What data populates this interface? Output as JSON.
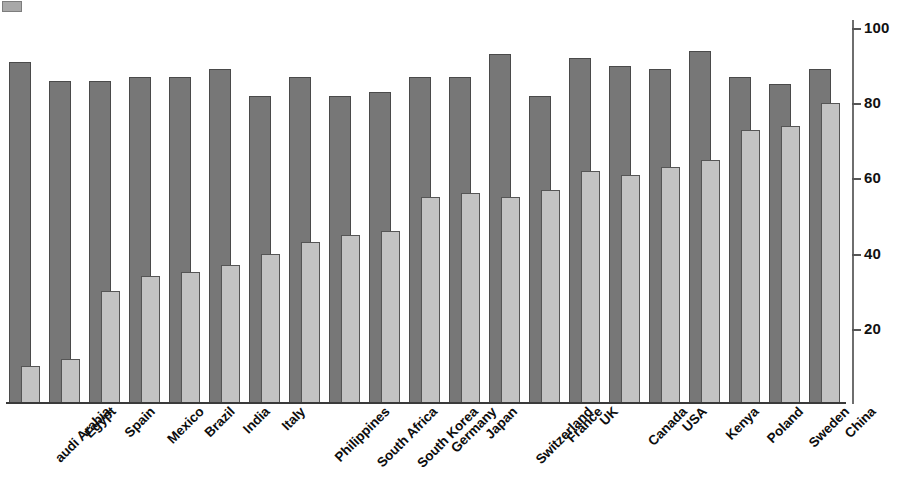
{
  "chart_data": {
    "type": "bar",
    "title": "",
    "subtitle": "",
    "xlabel": "",
    "ylabel": "",
    "ylim": [
      0,
      100
    ],
    "grid": false,
    "legend_position": "none",
    "axis_side": "right",
    "categories": [
      "Saudi Arabia",
      "Egypt",
      "Spain",
      "Mexico",
      "Brazil",
      "India",
      "Italy",
      "Philippines",
      "South Africa",
      "South Korea",
      "Germany",
      "Japan",
      "Switzerland",
      "France",
      "UK",
      "Canada",
      "USA",
      "Kenya",
      "Poland",
      "Sweden",
      "China"
    ],
    "tick_labels": [
      "20",
      "40",
      "60",
      "80",
      "100"
    ],
    "tick_values": [
      20,
      40,
      60,
      80,
      100
    ],
    "series": [
      {
        "name": "series-dark",
        "color": "#777777",
        "values": [
          91,
          86,
          86,
          87,
          87,
          89,
          82,
          87,
          82,
          83,
          87,
          87,
          93,
          82,
          92,
          90,
          89,
          94,
          87,
          85,
          89
        ]
      },
      {
        "name": "series-light",
        "color": "#c3c3c3",
        "values": [
          10,
          12,
          30,
          34,
          35,
          37,
          40,
          43,
          45,
          46,
          55,
          56,
          55,
          57,
          62,
          61,
          63,
          65,
          73,
          74,
          80
        ]
      }
    ]
  },
  "colors": {
    "background": "#ffffff",
    "series_dark": "#777777",
    "series_dark_edge": "#4a4a4a",
    "series_light": "#c3c3c3",
    "series_light_edge": "#555555",
    "axis": "#6e6e6e",
    "text": "#0d0d0d"
  },
  "first_category_clipped_text": "audi Arabia"
}
